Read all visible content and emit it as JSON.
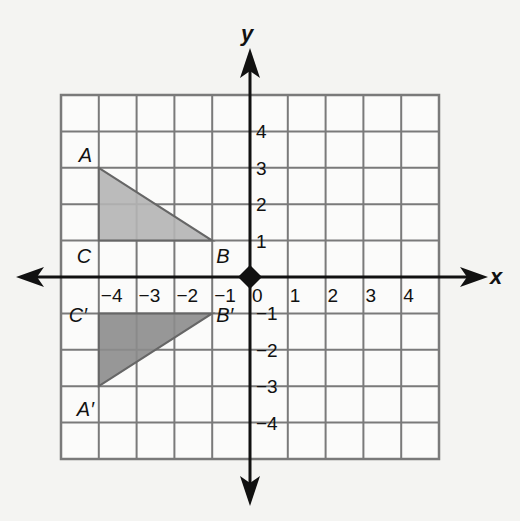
{
  "diagram": {
    "type": "coordinate-plane-reflection",
    "axes": {
      "x_label": "x",
      "y_label": "y",
      "x_ticks": [
        "−4",
        "−3",
        "−2",
        "−1",
        "0",
        "1",
        "2",
        "3",
        "4"
      ],
      "y_ticks": [
        "4",
        "3",
        "2",
        "1",
        "−1",
        "−2",
        "−3",
        "−4"
      ],
      "range": [
        -5,
        5
      ]
    },
    "colors": {
      "grid": "#7a7a7a",
      "axis": "#111111",
      "triangle_original": "#b4b4b4",
      "triangle_image": "#8c8c8c",
      "background": "#f4f4f2"
    },
    "triangle_original": {
      "label": "Triangle ABC",
      "points": [
        {
          "name": "A",
          "x": -4,
          "y": 3
        },
        {
          "name": "B",
          "x": -1,
          "y": 1
        },
        {
          "name": "C",
          "x": -4,
          "y": 1
        }
      ]
    },
    "triangle_image": {
      "label": "Triangle A′B′C′",
      "points": [
        {
          "name": "A′",
          "x": -4,
          "y": -3
        },
        {
          "name": "B′",
          "x": -1,
          "y": -1
        },
        {
          "name": "C′",
          "x": -4,
          "y": -1
        }
      ]
    },
    "origin_marker": "diamond"
  }
}
